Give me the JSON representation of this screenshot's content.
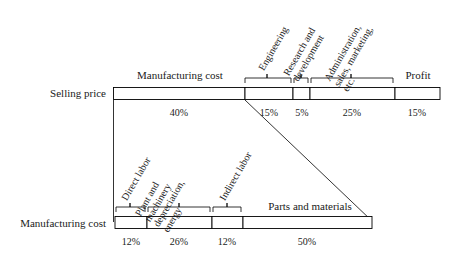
{
  "diagram": {
    "line_color": "#000000",
    "bar_fill": "#ffffff"
  },
  "top_row": {
    "row_label": "Selling price",
    "headers": {
      "manufacturing_cost": "Manufacturing cost",
      "profit": "Profit"
    },
    "segments": [
      {
        "name": "manufacturing-cost",
        "label": "",
        "percent": "40%",
        "value": 40
      },
      {
        "name": "engineering",
        "label": "Engineering",
        "percent": "15%",
        "value": 15
      },
      {
        "name": "research-and-development",
        "label": "Research and development",
        "percent": "5%",
        "value": 5
      },
      {
        "name": "administration-sales-marketing",
        "label": "Administration, sales, marketing, etc.",
        "percent": "25%",
        "value": 25
      },
      {
        "name": "profit",
        "label": "Profit",
        "percent": "15%",
        "value": 15
      }
    ],
    "rotated_labels": [
      {
        "lines": [
          "Engineering"
        ]
      },
      {
        "lines": [
          "Research and",
          "development"
        ]
      },
      {
        "lines": [
          "Administration,",
          "sales, marketing,",
          "etc."
        ]
      }
    ]
  },
  "bottom_row": {
    "row_label": "Manufacturing cost",
    "headers": {
      "parts_and_materials": "Parts and materials"
    },
    "segments": [
      {
        "name": "direct-labor",
        "label": "Direct labor",
        "percent": "12%",
        "value": 12
      },
      {
        "name": "plant-machinery-depreciation-energy",
        "label": "Plant and machinery depreciation, energy",
        "percent": "26%",
        "value": 26
      },
      {
        "name": "indirect-labor",
        "label": "Indirect labor",
        "percent": "12%",
        "value": 12
      },
      {
        "name": "parts-and-materials",
        "label": "Parts and materials",
        "percent": "50%",
        "value": 50
      }
    ],
    "rotated_labels": [
      {
        "lines": [
          "Direct labor"
        ]
      },
      {
        "lines": [
          "Plant and",
          "machinery",
          "depreciation,",
          "energy"
        ]
      },
      {
        "lines": [
          "Indirect labor"
        ]
      }
    ]
  }
}
